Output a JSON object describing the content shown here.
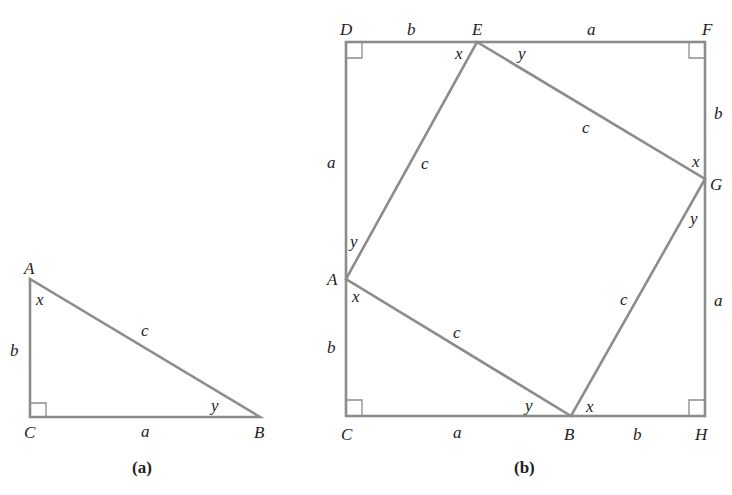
{
  "figure_a": {
    "caption": "(a)",
    "vertices": {
      "A": "A",
      "B": "B",
      "C": "C"
    },
    "sides": {
      "a": "a",
      "b": "b",
      "c": "c"
    },
    "angles": {
      "x": "x",
      "y": "y"
    },
    "right_angle_at": "C"
  },
  "figure_b": {
    "caption": "(b)",
    "vertices": {
      "D": "D",
      "E": "E",
      "F": "F",
      "G": "G",
      "H": "H",
      "B": "B",
      "C": "C",
      "A": "A"
    },
    "side_labels": {
      "DE": "b",
      "EF": "a",
      "FG": "b",
      "GH": "a",
      "HB": "b",
      "BC": "a",
      "CA": "b",
      "AD": "a",
      "EG": "c",
      "GB": "c",
      "BA": "c",
      "AE": "c"
    },
    "angle_labels": {
      "E_left": "x",
      "E_right": "y",
      "G_top": "x",
      "G_bottom": "y",
      "B_left": "y",
      "B_right": "x",
      "A_top": "y",
      "A_bottom": "x"
    },
    "right_angles_at": [
      "D",
      "F",
      "H",
      "C"
    ]
  }
}
